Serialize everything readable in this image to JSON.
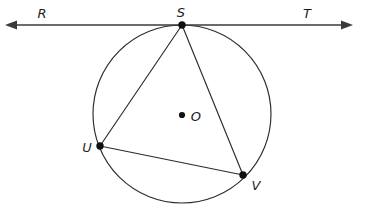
{
  "figure": {
    "kind": "circle-geometry-diagram",
    "width": 368,
    "height": 218,
    "background_color": "#ffffff",
    "stroke_color": "#2b2b2b",
    "label_color": "#1d1d1d",
    "dot_color": "#101010"
  },
  "labels": {
    "R": "R",
    "S": "S",
    "T": "T",
    "O": "O",
    "U": "U",
    "V": "V"
  },
  "geometry": {
    "circle": {
      "center_label": "O",
      "center_x": 182,
      "center_y": 114,
      "radius": 89
    },
    "points": [
      {
        "label": "S",
        "x": 182,
        "y": 25,
        "on_circle": true
      },
      {
        "label": "U",
        "x": 100,
        "y": 146,
        "on_circle": true
      },
      {
        "label": "V",
        "x": 243,
        "y": 175,
        "on_circle": true
      },
      {
        "label": "O",
        "x": 182,
        "y": 115,
        "on_circle": false
      }
    ],
    "tangent_line": {
      "labels": [
        "R",
        "S",
        "T"
      ],
      "y": 25,
      "x_start": 6,
      "x_end": 352,
      "double_arrow": true,
      "tangent_point": "S"
    },
    "chords": [
      {
        "from": "S",
        "to": "U"
      },
      {
        "from": "S",
        "to": "V"
      },
      {
        "from": "U",
        "to": "V"
      }
    ]
  }
}
